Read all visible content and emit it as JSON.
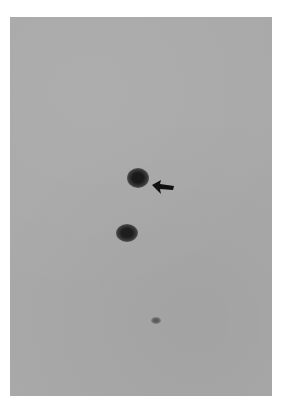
{
  "figure": {
    "type": "grayscale plate / autoradiograph",
    "background_color": "#a9a9a9",
    "spots": [
      {
        "id": "upper",
        "label": "",
        "intensity": "strong",
        "marked_by_arrow": true
      },
      {
        "id": "lower",
        "label": "",
        "intensity": "strong",
        "marked_by_arrow": false
      },
      {
        "id": "faint",
        "label": "",
        "intensity": "faint",
        "marked_by_arrow": false
      }
    ],
    "annotations": [
      {
        "type": "arrow",
        "direction": "left",
        "points_to": "upper"
      }
    ],
    "header_bleed_text": ""
  }
}
